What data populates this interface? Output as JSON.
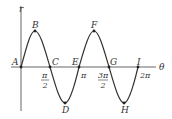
{
  "figure": {
    "axes": {
      "vertical_label": "r",
      "horizontal_label": "θ"
    },
    "points": [
      {
        "id": "A",
        "label": "A"
      },
      {
        "id": "B",
        "label": "B"
      },
      {
        "id": "C",
        "label": "C"
      },
      {
        "id": "D",
        "label": "D"
      },
      {
        "id": "E",
        "label": "E"
      },
      {
        "id": "F",
        "label": "F"
      },
      {
        "id": "G",
        "label": "G"
      },
      {
        "id": "H",
        "label": "H"
      },
      {
        "id": "I",
        "label": "I"
      }
    ],
    "ticks": {
      "pi_over_2_num": "π",
      "pi_over_2_den": "2",
      "pi": "π",
      "three_pi_over_2_num": "3π",
      "three_pi_over_2_den": "2",
      "two_pi": "2π"
    },
    "colors": {
      "curve": "#333333",
      "axes": "#555555"
    }
  }
}
